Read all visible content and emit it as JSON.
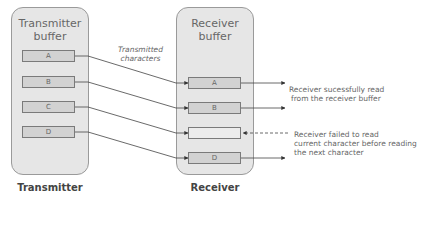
{
  "transmitter": {
    "buffer_title": "Transmitter buffer",
    "title_line1": "Transmitter",
    "title_line2": "buffer",
    "label": "Transmitter",
    "cells": [
      "A",
      "B",
      "C",
      "D"
    ]
  },
  "receiver": {
    "buffer_title": "Receiver buffer",
    "title_line1": "Receiver",
    "title_line2": "buffer",
    "label": "Receiver",
    "cells": [
      "A",
      "B",
      "",
      "D"
    ]
  },
  "annotations": {
    "transmitted_line1": "Transmitted",
    "transmitted_line2": "characters",
    "success_line1": "Receiver sucessfully read",
    "success_line2": "from the receiver buffer",
    "failed_line1": "Receiver failed to read",
    "failed_line2": "current character before reading",
    "failed_line3": "the next character"
  }
}
